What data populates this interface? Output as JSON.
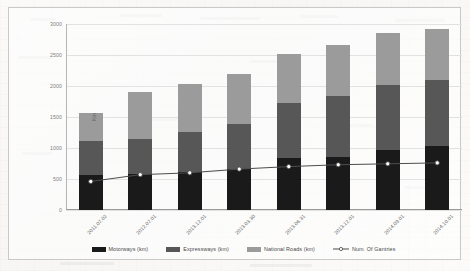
{
  "chart_data": {
    "type": "bar",
    "subtype": "stacked-bar-with-line-overlay",
    "title": "",
    "xlabel": "",
    "ylabel": "Km",
    "ylim": [
      0,
      3000
    ],
    "yticks": [
      0,
      500,
      1000,
      1500,
      2000,
      2500,
      3000
    ],
    "ytick_labels": [
      "0",
      "500",
      "1000",
      "1500",
      "2000",
      "2500",
      "3000"
    ],
    "grid": true,
    "legend_position": "bottom",
    "categories": [
      "2011.07.02",
      "2012.07.01",
      "2013.12.01",
      "2013.03.30",
      "2013.06.31",
      "2013.12.01",
      "2014.09.01",
      "2014.10.01"
    ],
    "series": [
      {
        "name": "Motorways (km)",
        "type": "bar",
        "color": "#1a1a1a",
        "values": [
          570,
          580,
          610,
          660,
          840,
          850,
          970,
          1030
        ]
      },
      {
        "name": "Expressways (km)",
        "type": "bar",
        "color": "#575757",
        "values": [
          550,
          560,
          650,
          730,
          890,
          990,
          1050,
          1060
        ]
      },
      {
        "name": "National Roads (km)",
        "type": "bar",
        "color": "#9b9b9b",
        "values": [
          450,
          760,
          770,
          810,
          790,
          820,
          840,
          830
        ]
      },
      {
        "name": "Num. Of Gantries",
        "type": "line",
        "color": "#4d4d4d",
        "marker": "circle-open",
        "values": [
          460,
          570,
          600,
          660,
          700,
          730,
          745,
          760
        ]
      }
    ],
    "stack_totals": [
      1570,
      1900,
      2030,
      2200,
      2520,
      2660,
      2860,
      2920
    ]
  },
  "legend": {
    "items": [
      {
        "label": "Motorways (km)",
        "marker": "square",
        "color": "#1a1a1a"
      },
      {
        "label": "Expressways (km)",
        "marker": "square",
        "color": "#575757"
      },
      {
        "label": "National Roads (km)",
        "marker": "square",
        "color": "#9b9b9b"
      },
      {
        "label": "Num. Of Gantries",
        "marker": "line-circle",
        "color": "#4d4d4d"
      }
    ]
  }
}
